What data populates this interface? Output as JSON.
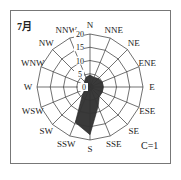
{
  "title": "7月",
  "calm_label": "C=1",
  "chart_data": {
    "type": "radar",
    "subtype": "wind-rose",
    "title": "7月",
    "directions": [
      "N",
      "NNE",
      "NE",
      "ENE",
      "E",
      "ESE",
      "SE",
      "SSE",
      "S",
      "SSW",
      "SW",
      "WSW",
      "W",
      "WNW",
      "NW",
      "NNW"
    ],
    "values": [
      4.5,
      4,
      4.5,
      5,
      5,
      5,
      5,
      8,
      18,
      14.5,
      4,
      2,
      1.5,
      2,
      3,
      4
    ],
    "radial_ticks": [
      0,
      5,
      10,
      15,
      20
    ],
    "rlim": [
      0,
      20
    ],
    "annotation": "C=1",
    "fill_color": "#3a3a3a",
    "grid": true
  }
}
